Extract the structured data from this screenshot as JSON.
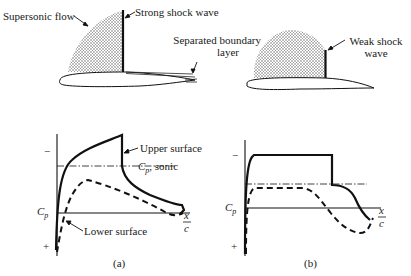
{
  "figure": {
    "top_left": {
      "labels": {
        "supersonic_flow": "Supersonic flow",
        "strong_shock": "Strong shock wave",
        "separated_line1": "Separated boundary",
        "separated_line2": "layer"
      }
    },
    "top_right": {
      "labels": {
        "weak_shock_line1": "Weak shock",
        "weak_shock_line2": "wave"
      }
    },
    "plot_a": {
      "minus": "−",
      "plus": "+",
      "cp": "C",
      "cp_sub": "p",
      "upper_surface": "Upper surface",
      "cp_sonic_c": "C",
      "cp_sonic_sub": "p",
      "cp_sonic_rest": ", sonic",
      "lower_surface": "Lower surface",
      "x_num": "x",
      "x_den": "c",
      "caption": "(a)"
    },
    "plot_b": {
      "minus": "−",
      "plus": "+",
      "cp": "C",
      "cp_sub": "p",
      "x_num": "x",
      "x_den": "c",
      "caption": "(b)"
    }
  },
  "colors": {
    "ink": "#111111",
    "background": "#ffffff",
    "stipple": "#555555"
  }
}
